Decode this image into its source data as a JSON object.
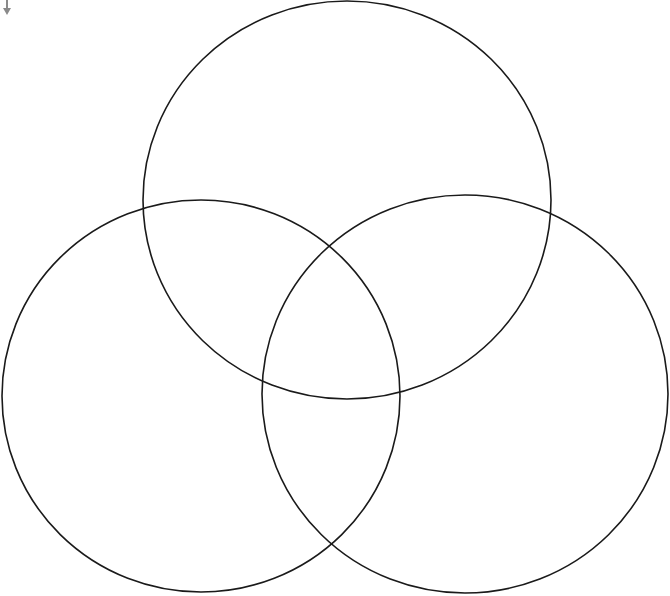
{
  "diagram": {
    "type": "venn",
    "set_count": 3,
    "background": "#ffffff",
    "stroke_color": "#1a1a1a",
    "circles": [
      {
        "id": "top",
        "cx": 347,
        "cy": 200,
        "rx": 204,
        "ry": 199
      },
      {
        "id": "left",
        "cx": 201,
        "cy": 396,
        "rx": 199,
        "ry": 196
      },
      {
        "id": "right",
        "cx": 465,
        "cy": 394,
        "rx": 203,
        "ry": 199
      }
    ],
    "labels": []
  },
  "corner_marker": {
    "icon": "caret-down-icon",
    "color": "#8a8a8a"
  }
}
